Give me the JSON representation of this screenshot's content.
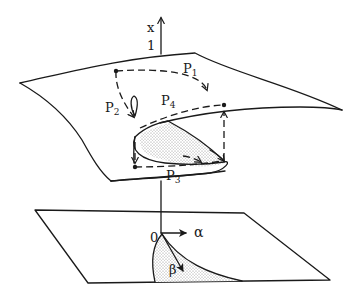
{
  "diagram": {
    "type": "cusp-catastrophe-surface",
    "axis_labels": {
      "vertical": "x",
      "vertical_tick": "1",
      "origin": "0",
      "alpha": "α",
      "beta": "β"
    },
    "paths": [
      {
        "id": "P1",
        "label": "P",
        "subscript": "1"
      },
      {
        "id": "P2",
        "label": "P",
        "subscript": "2"
      },
      {
        "id": "P3",
        "label": "P",
        "subscript": "3"
      },
      {
        "id": "P4",
        "label": "P",
        "subscript": "4"
      }
    ],
    "colors": {
      "stroke": "#1a1a1a",
      "shading": "#9a9a9a",
      "background": "#ffffff"
    }
  }
}
